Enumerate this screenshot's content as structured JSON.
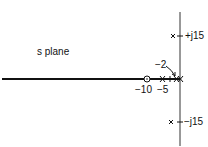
{
  "title": "s plane",
  "labels": {
    "plus_j15": "+j15",
    "minus_j15": "−j15",
    "zero_label": "−10",
    "pole_5_label": "−5",
    "pole_2_label": "−2"
  },
  "elements": {
    "poles": [
      {
        "re": 0,
        "im": 15
      },
      {
        "re": 0,
        "im": -15
      },
      {
        "re": -5,
        "im": 0
      },
      {
        "re": -2,
        "im": 0
      },
      {
        "re": 0,
        "im": 0
      }
    ],
    "zeros": [
      {
        "re": -10,
        "im": 0
      }
    ],
    "root_locus_real_axis": "thick segment along negative real axis"
  }
}
